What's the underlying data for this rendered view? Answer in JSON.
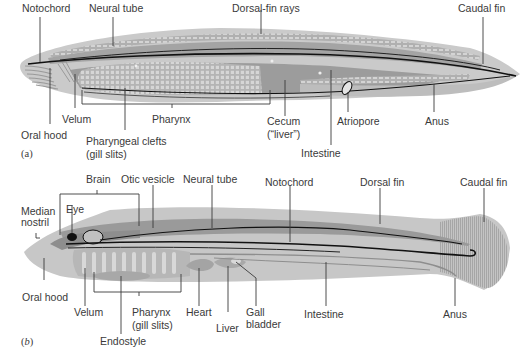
{
  "figure_a": {
    "panel_label": "(a)",
    "labels": {
      "notochord": "Notochord",
      "neural_tube": "Neural tube",
      "dorsal_fin_rays": "Dorsal-fin rays",
      "caudal_fin": "Caudal fin",
      "oral_hood": "Oral hood",
      "velum": "Velum",
      "pharynx": "Pharynx",
      "pharyngeal_clefts_1": "Pharyngeal clefts",
      "pharyngeal_clefts_2": "(gill slits)",
      "cecum_1": "Cecum",
      "cecum_2": "(“liver”)",
      "atriopore": "Atriopore",
      "intestine": "Intestine",
      "anus": "Anus"
    }
  },
  "figure_b": {
    "panel_label_open": "(",
    "panel_label_letter": "b",
    "panel_label_close": ")",
    "labels": {
      "brain": "Brain",
      "otic_vesicle": "Otic vesicle",
      "neural_tube": "Neural tube",
      "notochord": "Notochord",
      "dorsal_fin": "Dorsal fin",
      "caudal_fin": "Caudal fin",
      "median_nostril_1": "Median",
      "median_nostril_2": "nostril",
      "eye": "Eye",
      "oral_hood": "Oral hood",
      "velum": "Velum",
      "pharynx_1": "Pharynx",
      "pharynx_2": "(gill slits)",
      "heart": "Heart",
      "liver": "Liver",
      "gall_bladder_1": "Gall",
      "gall_bladder_2": "bladder",
      "intestine": "Intestine",
      "anus": "Anus",
      "endostyle": "Endostyle"
    }
  },
  "colors": {
    "body_light": "#c8c8c8",
    "body_mid": "#a9a9a9",
    "body_dark": "#8e8e8e",
    "outline": "#1a1a1a",
    "leader": "#3a3a3a"
  }
}
